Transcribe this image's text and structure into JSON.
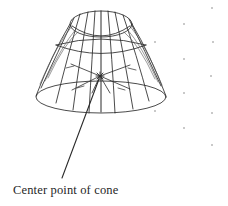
{
  "figure": {
    "title": "Center point of cone",
    "background_color": "#ffffff",
    "line_color": "#2b2b2b",
    "artifact_color": "#c9c9c9",
    "annotation": {
      "label": "Center point of cone",
      "leader_line": {
        "from_x": 99,
        "from_y": 79,
        "to_x": 62,
        "to_y": 178
      },
      "center_marker": {
        "x": 100,
        "y": 76,
        "symbol": "star"
      }
    },
    "cone": {
      "type": "wireframe-truncated-cone",
      "apex_center_x": 101,
      "top_ellipse": {
        "cx": 101,
        "cy": 24,
        "rx": 31,
        "ry": 13
      },
      "mid_ellipse": {
        "cx": 101,
        "cy": 47,
        "rx": 49,
        "ry": 13
      },
      "bottom_ellipse": {
        "cx": 101,
        "cy": 97,
        "rx": 65,
        "ry": 16
      },
      "axis_line": {
        "x": 101,
        "y_top": 11,
        "y_bottom": 112
      },
      "meridian_count": 12,
      "spoke_count": 6
    },
    "artifact_dots": [
      {
        "x": 212,
        "y": 8
      },
      {
        "x": 184,
        "y": 24
      },
      {
        "x": 213,
        "y": 42
      },
      {
        "x": 155,
        "y": 42
      },
      {
        "x": 184,
        "y": 59
      },
      {
        "x": 211,
        "y": 76
      },
      {
        "x": 184,
        "y": 93
      },
      {
        "x": 155,
        "y": 111
      },
      {
        "x": 212,
        "y": 113
      },
      {
        "x": 184,
        "y": 128
      },
      {
        "x": 212,
        "y": 145
      }
    ]
  }
}
